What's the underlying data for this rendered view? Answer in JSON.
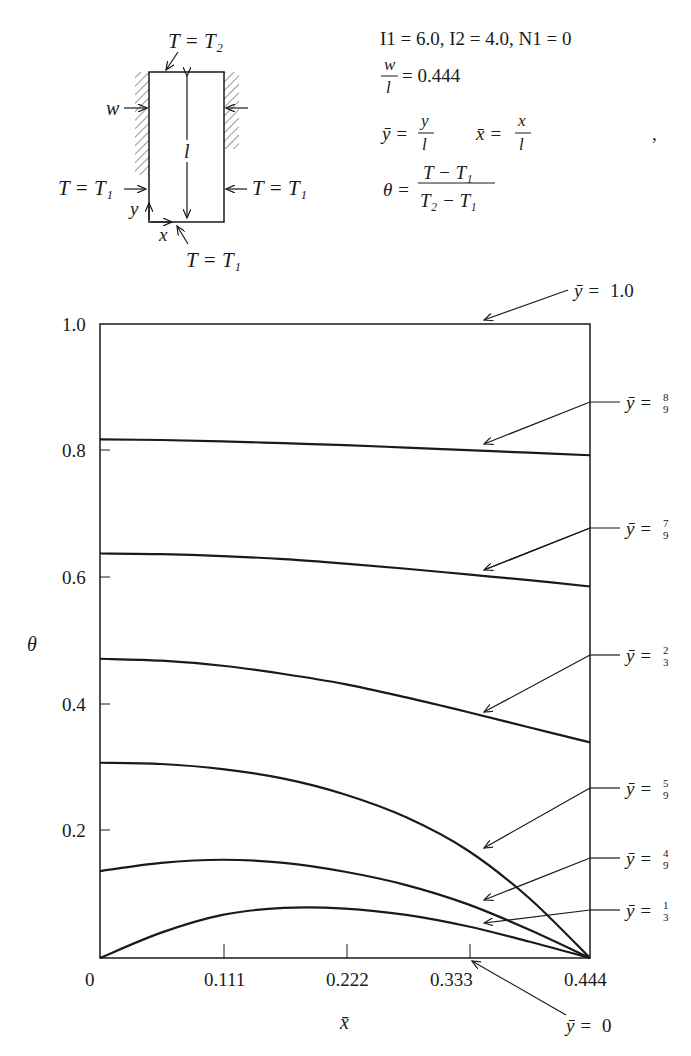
{
  "diagram": {
    "top_label": "T = T₂",
    "bottom_label": "T = T₁",
    "left_label": "T = T₁",
    "right_label": "T = T₁",
    "width_label": "w",
    "length_label": "l",
    "x_axis_label": "x",
    "y_axis_label": "y"
  },
  "parameters": {
    "line1": "I1 = 6.0, I2 = 4.0, N1 = 0",
    "ratio_num": "w",
    "ratio_den": "l",
    "ratio_value": "= 0.444",
    "ybar_def_lhs": "ȳ =",
    "ybar_def_num": "y",
    "ybar_def_den": "l",
    "xbar_def_lhs": "x̄ =",
    "xbar_def_num": "x",
    "xbar_def_den": "l",
    "theta_def_lhs": "θ =",
    "theta_def_num": "T − T₁",
    "theta_def_den": "T₂ − T₁",
    "trailing_mark": ","
  },
  "chart_data": {
    "type": "line",
    "title": "",
    "xlabel": "x̄",
    "ylabel": "θ",
    "xlim": [
      0,
      0.444
    ],
    "ylim": [
      0,
      1.0
    ],
    "grid": false,
    "x_ticks": [
      "0",
      "0.111",
      "0.222",
      "0.333",
      "0.444"
    ],
    "y_ticks": [
      "0.2",
      "0.4",
      "0.6",
      "0.8",
      "1.0"
    ],
    "x": [
      0,
      0.0555,
      0.111,
      0.1665,
      0.222,
      0.2775,
      0.333,
      0.3885,
      0.444
    ],
    "series": [
      {
        "name": "ȳ = 1.0",
        "label": "1.0",
        "values": [
          1.0,
          1.0,
          1.0,
          1.0,
          1.0,
          1.0,
          1.0,
          1.0,
          1.0
        ]
      },
      {
        "name": "ȳ = 8/9",
        "label": "8/9",
        "values": [
          0.818,
          0.817,
          0.815,
          0.812,
          0.809,
          0.805,
          0.801,
          0.797,
          0.793
        ]
      },
      {
        "name": "ȳ = 7/9",
        "label": "7/9",
        "values": [
          0.638,
          0.637,
          0.634,
          0.629,
          0.622,
          0.614,
          0.605,
          0.596,
          0.586
        ]
      },
      {
        "name": "ȳ = 2/3",
        "label": "2/3",
        "values": [
          0.472,
          0.469,
          0.461,
          0.448,
          0.432,
          0.411,
          0.388,
          0.364,
          0.34
        ]
      },
      {
        "name": "ȳ = 5/9",
        "label": "5/9",
        "values": [
          0.308,
          0.306,
          0.298,
          0.283,
          0.258,
          0.222,
          0.17,
          0.095,
          0.0
        ]
      },
      {
        "name": "ȳ = 4/9",
        "label": "4/9",
        "values": [
          0.137,
          0.15,
          0.155,
          0.15,
          0.136,
          0.115,
          0.085,
          0.045,
          0.0
        ]
      },
      {
        "name": "ȳ = 1/3",
        "label": "1/3",
        "values": [
          0.0,
          0.04,
          0.068,
          0.079,
          0.078,
          0.068,
          0.05,
          0.026,
          0.0
        ]
      },
      {
        "name": "ȳ = 0",
        "label": "0",
        "values": [
          0,
          0,
          0,
          0,
          0,
          0,
          0,
          0,
          0
        ]
      }
    ],
    "annotations": [
      {
        "text": "ȳ = 1.0",
        "num": "1.0",
        "den": ""
      },
      {
        "text": "ȳ = 8/9",
        "num": "8",
        "den": "9"
      },
      {
        "text": "ȳ = 7/9",
        "num": "7",
        "den": "9"
      },
      {
        "text": "ȳ = 2/3",
        "num": "2",
        "den": "3"
      },
      {
        "text": "ȳ = 5/9",
        "num": "5",
        "den": "9"
      },
      {
        "text": "ȳ = 4/9",
        "num": "4",
        "den": "9"
      },
      {
        "text": "ȳ = 1/3",
        "num": "1",
        "den": "3"
      },
      {
        "text": "ȳ = 0",
        "num": "0",
        "den": ""
      }
    ]
  },
  "labels": {
    "ybar_eq": "ȳ =",
    "zero": "0"
  }
}
